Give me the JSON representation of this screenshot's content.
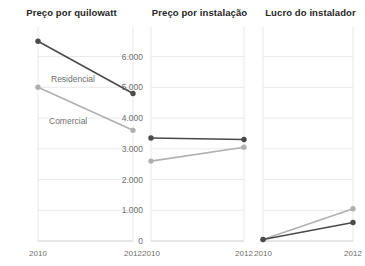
{
  "chart_data": {
    "type": "line",
    "title": "",
    "layout": "small-multiples-horizontal",
    "panel_count": 3,
    "shared_y_axis": true,
    "grid": true,
    "grid_axis": "y",
    "legend": "inline-series-labels-on-first-panel",
    "x": [
      2010,
      2012
    ],
    "xlabel": "",
    "ylabel": "",
    "ylim": [
      0,
      6800
    ],
    "yticks": [
      0,
      1000,
      2000,
      3000,
      4000,
      5000,
      6000
    ],
    "ytick_labels": [
      "0",
      "1.000",
      "2.000",
      "3.000",
      "4.000",
      "5.000",
      "6.000"
    ],
    "xtick_labels": [
      "2010",
      "2012"
    ],
    "series_names": [
      "Residencial",
      "Comercial"
    ],
    "colors": {
      "residencial": "#4a4a4a",
      "comercial": "#b0b0b0",
      "grid": "#e3e3e3",
      "axis": "#cccccc",
      "tick_text": "#6e6e6e",
      "title_text": "#262626"
    },
    "panels": [
      {
        "title": "Preço por quilowatt",
        "show_y_tick_labels": true,
        "show_series_labels": true,
        "series": [
          {
            "name": "Residencial",
            "values": [
              6500,
              4800
            ]
          },
          {
            "name": "Comercial",
            "values": [
              5000,
              3600
            ]
          }
        ]
      },
      {
        "title": "Preço por instalação",
        "show_y_tick_labels": false,
        "show_series_labels": false,
        "series": [
          {
            "name": "Residencial",
            "values": [
              3350,
              3300
            ]
          },
          {
            "name": "Comercial",
            "values": [
              2600,
              3050
            ]
          }
        ]
      },
      {
        "title": "Lucro do instalador",
        "show_y_tick_labels": false,
        "show_series_labels": false,
        "series": [
          {
            "name": "Residencial",
            "values": [
              50,
              600
            ]
          },
          {
            "name": "Comercial",
            "values": [
              50,
              1050
            ]
          }
        ]
      }
    ]
  }
}
